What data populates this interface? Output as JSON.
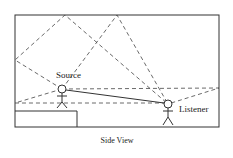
{
  "diagram": {
    "caption": "Side View",
    "labels": {
      "source": "Source",
      "listener": "Listener"
    },
    "colors": {
      "line": "#333333",
      "background": "#ffffff"
    },
    "elements": [
      "room-outline",
      "platform",
      "source-figure",
      "listener-figure",
      "direct-path",
      "reflection-paths"
    ]
  }
}
